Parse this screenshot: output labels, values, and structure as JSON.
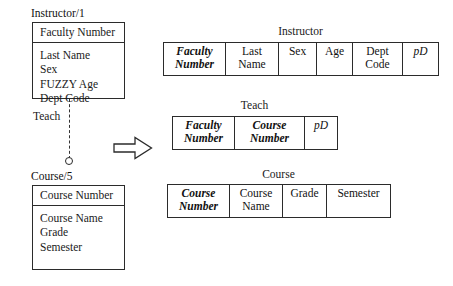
{
  "diagram": {
    "title_semantic": "fuzzy-er-to-relational-mapping",
    "arrow_symbol": "transform-arrow-right"
  },
  "er": {
    "entities": [
      {
        "label": "Instructor/1",
        "key": "Faculty Number",
        "attributes": [
          "Last Name",
          "Sex",
          "FUZZY Age",
          "Dept Code"
        ]
      },
      {
        "label": "Course/5",
        "key": "Course Number",
        "attributes": [
          "Course Name",
          "Grade",
          "Semester"
        ]
      }
    ],
    "relationship": {
      "name": "Teach",
      "line_style": "dashed",
      "endpoint_shape": "circle"
    }
  },
  "relational": {
    "tables": [
      {
        "title": "Instructor",
        "columns": [
          {
            "lines": [
              "Faculty",
              "Number"
            ],
            "style": "key"
          },
          {
            "lines": [
              "Last",
              "Name"
            ],
            "style": "plain"
          },
          {
            "lines": [
              "Sex"
            ],
            "style": "plain"
          },
          {
            "lines": [
              "Age"
            ],
            "style": "plain"
          },
          {
            "lines": [
              "Dept",
              "Code"
            ],
            "style": "plain"
          },
          {
            "lines": [
              "pD"
            ],
            "style": "deg"
          }
        ]
      },
      {
        "title": "Teach",
        "columns": [
          {
            "lines": [
              "Faculty",
              "Number"
            ],
            "style": "key"
          },
          {
            "lines": [
              "Course",
              "Number"
            ],
            "style": "key"
          },
          {
            "lines": [
              "pD"
            ],
            "style": "deg"
          }
        ]
      },
      {
        "title": "Course",
        "columns": [
          {
            "lines": [
              "Course",
              "Number"
            ],
            "style": "key"
          },
          {
            "lines": [
              "Course",
              "Name"
            ],
            "style": "plain"
          },
          {
            "lines": [
              "Grade"
            ],
            "style": "plain"
          },
          {
            "lines": [
              "Semester"
            ],
            "style": "plain"
          }
        ]
      }
    ]
  },
  "colors": {
    "stroke": "#2b2b2b",
    "text": "#111111",
    "background": "#ffffff"
  }
}
